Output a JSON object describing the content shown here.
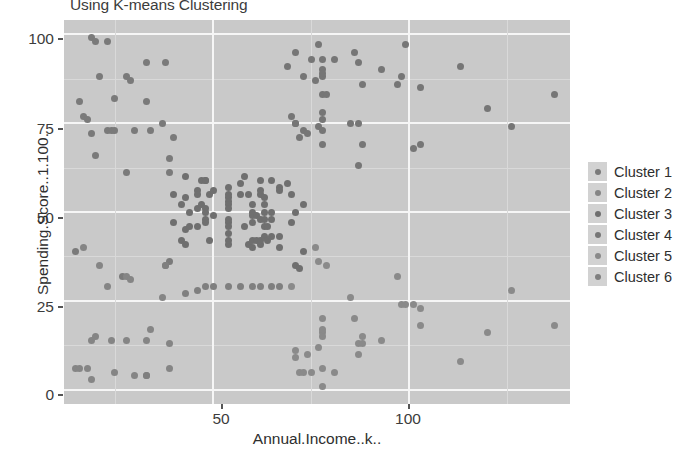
{
  "chart_data": {
    "type": "scatter",
    "title": "Using K-means Clustering",
    "xlabel": "Annual.Income..k..",
    "ylabel": "Spending.Score..1.100.",
    "xlim": [
      12,
      141
    ],
    "ylim": [
      -4,
      104
    ],
    "xticks": [
      50,
      100
    ],
    "xtick_labels": [
      "50",
      "100"
    ],
    "yticks": [
      0,
      25,
      50,
      75,
      100
    ],
    "ytick_labels": [
      "0",
      "25",
      "50",
      "75",
      "100"
    ],
    "grid": true,
    "legend_position": "right",
    "panel_background": "#c9c9c9",
    "gridline_color": "#f6f6f6",
    "point_color": "#7a7a7a",
    "legend": {
      "title": "",
      "entries": [
        {
          "name": "Cluster 1",
          "color": "#7a7a7a"
        },
        {
          "name": "Cluster 2",
          "color": "#858585"
        },
        {
          "name": "Cluster 3",
          "color": "#6f6f6f"
        },
        {
          "name": "Cluster 4",
          "color": "#767676"
        },
        {
          "name": "Cluster 5",
          "color": "#8a8a8a"
        },
        {
          "name": "Cluster 6",
          "color": "#7f7f7f"
        }
      ]
    },
    "series": [
      {
        "name": "Cluster 1",
        "color": "#7a7a7a",
        "points": [
          [
            15,
            39
          ],
          [
            16,
            81
          ],
          [
            17,
            77
          ],
          [
            18,
            76
          ],
          [
            19,
            72
          ],
          [
            19,
            99
          ],
          [
            20,
            66
          ],
          [
            20,
            98
          ],
          [
            21,
            88
          ],
          [
            23,
            73
          ],
          [
            23,
            98
          ],
          [
            24,
            73
          ],
          [
            25,
            73
          ],
          [
            25,
            82
          ],
          [
            27,
            32
          ],
          [
            28,
            61
          ],
          [
            28,
            88
          ],
          [
            29,
            87
          ],
          [
            30,
            73
          ],
          [
            33,
            92
          ],
          [
            33,
            81
          ],
          [
            34,
            73
          ],
          [
            37,
            75
          ],
          [
            38,
            92
          ],
          [
            39,
            61
          ],
          [
            39,
            65
          ],
          [
            39,
            36
          ],
          [
            40,
            71
          ]
        ]
      },
      {
        "name": "Cluster 2",
        "color": "#858585",
        "points": [
          [
            15,
            6
          ],
          [
            16,
            6
          ],
          [
            17,
            40
          ],
          [
            18,
            6
          ],
          [
            19,
            3
          ],
          [
            19,
            14
          ],
          [
            20,
            15
          ],
          [
            21,
            35
          ],
          [
            23,
            29
          ],
          [
            24,
            14
          ],
          [
            25,
            5
          ],
          [
            28,
            14
          ],
          [
            28,
            32
          ],
          [
            29,
            31
          ],
          [
            30,
            4
          ],
          [
            33,
            4
          ],
          [
            33,
            14
          ],
          [
            34,
            17
          ],
          [
            37,
            26
          ],
          [
            38,
            35
          ],
          [
            39,
            6
          ],
          [
            39,
            13
          ]
        ]
      },
      {
        "name": "Cluster 3",
        "color": "#6f6f6f",
        "points": [
          [
            40,
            55
          ],
          [
            40,
            47
          ],
          [
            42,
            42
          ],
          [
            42,
            52
          ],
          [
            43,
            60
          ],
          [
            43,
            54
          ],
          [
            43,
            45
          ],
          [
            43,
            41
          ],
          [
            44,
            50
          ],
          [
            44,
            46
          ],
          [
            46,
            51
          ],
          [
            46,
            46
          ],
          [
            46,
            56
          ],
          [
            46,
            55
          ],
          [
            47,
            52
          ],
          [
            47,
            59
          ],
          [
            48,
            51
          ],
          [
            48,
            59
          ],
          [
            48,
            50
          ],
          [
            48,
            48
          ],
          [
            48,
            59
          ],
          [
            48,
            47
          ],
          [
            49,
            55
          ],
          [
            49,
            42
          ],
          [
            50,
            49
          ],
          [
            50,
            56
          ],
          [
            54,
            47
          ],
          [
            54,
            54
          ],
          [
            54,
            53
          ],
          [
            54,
            48
          ],
          [
            54,
            52
          ],
          [
            54,
            42
          ],
          [
            54,
            51
          ],
          [
            54,
            55
          ],
          [
            54,
            41
          ],
          [
            54,
            44
          ],
          [
            54,
            57
          ],
          [
            54,
            46
          ],
          [
            57,
            58
          ],
          [
            57,
            55
          ],
          [
            58,
            60
          ],
          [
            58,
            46
          ],
          [
            59,
            55
          ],
          [
            59,
            41
          ],
          [
            60,
            49
          ],
          [
            60,
            40
          ],
          [
            60,
            42
          ],
          [
            60,
            52
          ],
          [
            60,
            47
          ],
          [
            60,
            50
          ],
          [
            61,
            42
          ],
          [
            61,
            49
          ],
          [
            62,
            41
          ],
          [
            62,
            48
          ],
          [
            62,
            59
          ],
          [
            62,
            55
          ],
          [
            62,
            56
          ],
          [
            62,
            42
          ],
          [
            63,
            50
          ],
          [
            63,
            46
          ],
          [
            63,
            43
          ],
          [
            63,
            48
          ],
          [
            63,
            52
          ],
          [
            63,
            54
          ],
          [
            64,
            42
          ],
          [
            64,
            46
          ],
          [
            65,
            48
          ],
          [
            65,
            50
          ],
          [
            65,
            43
          ],
          [
            65,
            59
          ],
          [
            67,
            43
          ],
          [
            67,
            57
          ],
          [
            67,
            56
          ],
          [
            67,
            40
          ],
          [
            69,
            58
          ],
          [
            70,
            55
          ],
          [
            70,
            47
          ],
          [
            71,
            35
          ],
          [
            71,
            50
          ],
          [
            72,
            34
          ],
          [
            73,
            39
          ],
          [
            73,
            52
          ]
        ]
      },
      {
        "name": "Cluster 4",
        "color": "#767676",
        "points": [
          [
            69,
            91
          ],
          [
            70,
            77
          ],
          [
            71,
            95
          ],
          [
            71,
            75
          ],
          [
            71,
            75
          ],
          [
            72,
            71
          ],
          [
            73,
            88
          ],
          [
            73,
            73
          ],
          [
            74,
            72
          ],
          [
            75,
            93
          ],
          [
            76,
            87
          ],
          [
            77,
            97
          ],
          [
            77,
            74
          ],
          [
            78,
            90
          ],
          [
            78,
            88
          ],
          [
            78,
            76
          ],
          [
            78,
            89
          ],
          [
            78,
            78
          ],
          [
            78,
            73
          ],
          [
            78,
            83
          ],
          [
            78,
            93
          ],
          [
            78,
            69
          ],
          [
            79,
            83
          ],
          [
            81,
            93
          ],
          [
            85,
            75
          ],
          [
            86,
            95
          ],
          [
            87,
            63
          ],
          [
            87,
            75
          ],
          [
            87,
            92
          ],
          [
            88,
            86
          ],
          [
            88,
            69
          ],
          [
            93,
            90
          ],
          [
            97,
            86
          ],
          [
            98,
            88
          ],
          [
            99,
            97
          ],
          [
            101,
            68
          ],
          [
            103,
            85
          ],
          [
            103,
            69
          ],
          [
            113,
            91
          ],
          [
            120,
            79
          ],
          [
            126,
            74
          ],
          [
            137,
            83
          ]
        ]
      },
      {
        "name": "Cluster 5",
        "color": "#8a8a8a",
        "points": [
          [
            70,
            29
          ],
          [
            71,
            9
          ],
          [
            71,
            11
          ],
          [
            72,
            5
          ],
          [
            73,
            5
          ],
          [
            74,
            10
          ],
          [
            75,
            5
          ],
          [
            76,
            40
          ],
          [
            77,
            12
          ],
          [
            77,
            36
          ],
          [
            78,
            1
          ],
          [
            78,
            6
          ],
          [
            78,
            20
          ],
          [
            78,
            16
          ],
          [
            78,
            15
          ],
          [
            78,
            17
          ],
          [
            79,
            35
          ],
          [
            81,
            5
          ],
          [
            85,
            26
          ],
          [
            86,
            20
          ],
          [
            87,
            13
          ],
          [
            87,
            10
          ],
          [
            88,
            13
          ],
          [
            88,
            15
          ],
          [
            93,
            14
          ],
          [
            97,
            32
          ],
          [
            98,
            24
          ],
          [
            99,
            24
          ],
          [
            101,
            24
          ],
          [
            103,
            23
          ],
          [
            103,
            18
          ],
          [
            113,
            8
          ],
          [
            120,
            16
          ],
          [
            126,
            28
          ],
          [
            137,
            18
          ]
        ]
      },
      {
        "name": "Cluster 6",
        "color": "#7f7f7f",
        "points": [
          [
            33,
            4
          ],
          [
            38,
            35
          ],
          [
            43,
            27
          ],
          [
            46,
            28
          ],
          [
            48,
            29
          ],
          [
            50,
            29
          ],
          [
            54,
            29
          ],
          [
            57,
            29
          ],
          [
            60,
            29
          ],
          [
            62,
            29
          ],
          [
            65,
            29
          ],
          [
            67,
            29
          ]
        ]
      }
    ]
  }
}
